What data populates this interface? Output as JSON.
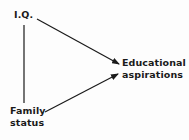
{
  "diagram": {
    "nodes": [
      {
        "id": "iq",
        "label": "I.Q."
      },
      {
        "id": "edu",
        "line1": "Educational",
        "line2": "aspirations"
      },
      {
        "id": "fam",
        "line1": "Family",
        "line2": "status"
      }
    ],
    "edges": [
      {
        "from": "I.Q.",
        "to": "Educational aspirations",
        "type": "arrow"
      },
      {
        "from": "Family status",
        "to": "Educational aspirations",
        "type": "arrow"
      },
      {
        "from": "I.Q.",
        "to": "Family status",
        "type": "line"
      }
    ]
  }
}
